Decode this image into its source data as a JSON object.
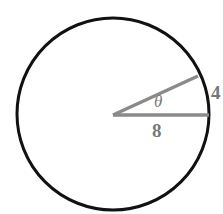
{
  "diagram": {
    "type": "circle-sector",
    "circle": {
      "cx": 113,
      "cy": 114,
      "r": 96,
      "stroke": "#111111"
    },
    "radius_label": "8",
    "arc_label": "4",
    "angle_label": "θ",
    "line_color": "#8a8a8a",
    "label_color": "#777777"
  }
}
